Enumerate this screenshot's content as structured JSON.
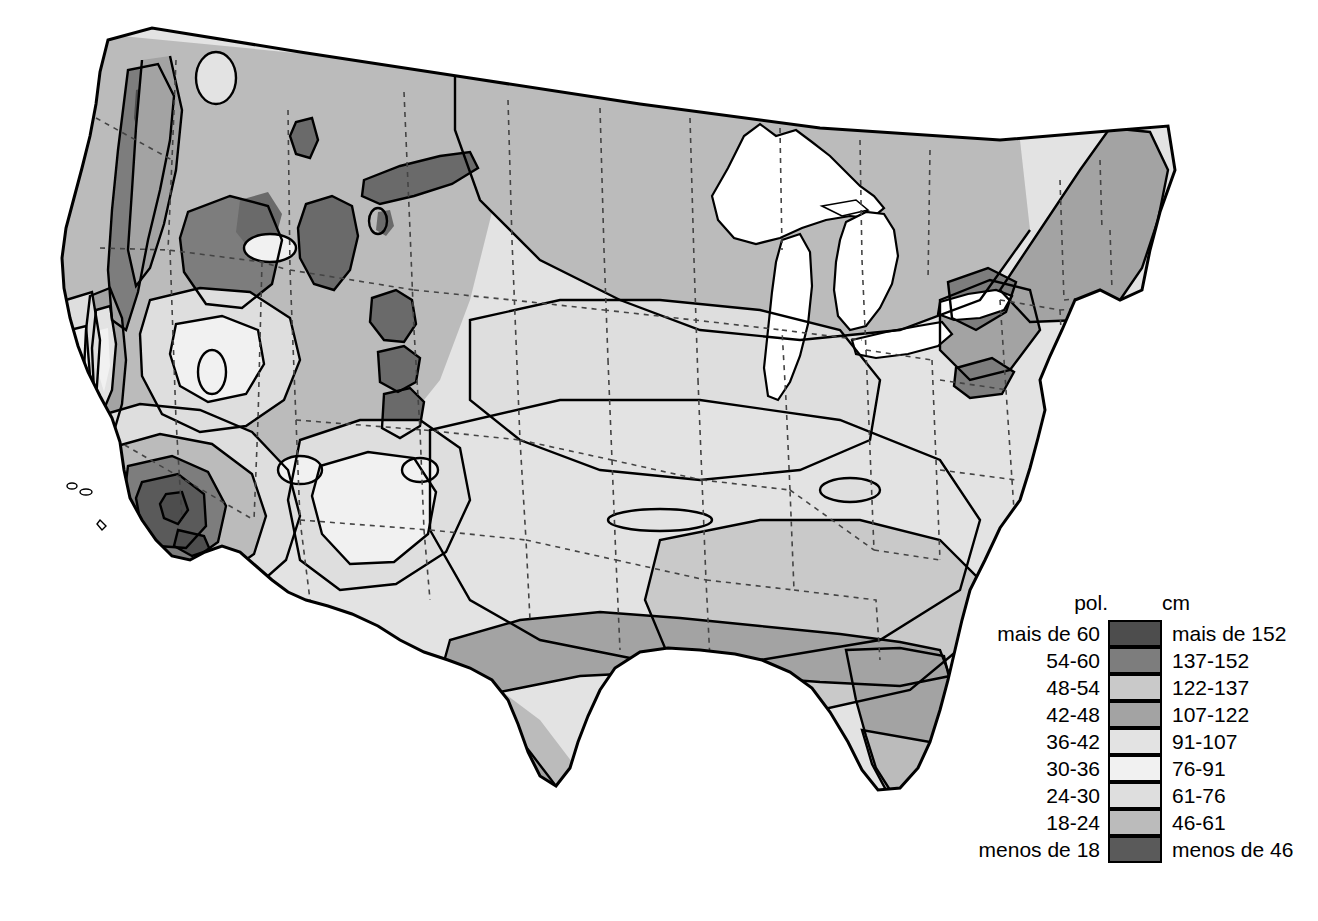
{
  "figure": {
    "background_color": "#ffffff",
    "outline_color": "#000000",
    "state_border_color": "#555555"
  },
  "legend": {
    "header_left": "pol.",
    "header_right": "cm",
    "rows": [
      {
        "inches": "mais de 60",
        "cm": "mais de 152",
        "color": "#4d4d4d"
      },
      {
        "inches": "54-60",
        "cm": "137-152",
        "color": "#7d7d7d"
      },
      {
        "inches": "48-54",
        "cm": "122-137",
        "color": "#c9c9c9"
      },
      {
        "inches": "42-48",
        "cm": "107-122",
        "color": "#a3a3a3"
      },
      {
        "inches": "36-42",
        "cm": "91-107",
        "color": "#e3e3e3"
      },
      {
        "inches": "30-36",
        "cm": "76-91",
        "color": "#f1f1f1"
      },
      {
        "inches": "24-30",
        "cm": "61-76",
        "color": "#dedede"
      },
      {
        "inches": "18-24",
        "cm": "46-61",
        "color": "#bbbbbb"
      },
      {
        "inches": "menos de 18",
        "cm": "menos de 46",
        "color": "#5a5a5a"
      }
    ]
  },
  "chart_data": {
    "type": "map",
    "units_primary": "pol.",
    "units_secondary": "cm",
    "classes": [
      {
        "label_in": "mais de 60",
        "label_cm": "mais de 152",
        "min_in": 60,
        "max_in": null,
        "min_cm": 152,
        "max_cm": null,
        "color": "#4d4d4d"
      },
      {
        "label_in": "54-60",
        "label_cm": "137-152",
        "min_in": 54,
        "max_in": 60,
        "min_cm": 137,
        "max_cm": 152,
        "color": "#7d7d7d"
      },
      {
        "label_in": "48-54",
        "label_cm": "122-137",
        "min_in": 48,
        "max_in": 54,
        "min_cm": 122,
        "max_cm": 137,
        "color": "#c9c9c9"
      },
      {
        "label_in": "42-48",
        "label_cm": "107-122",
        "min_in": 42,
        "max_in": 48,
        "min_cm": 107,
        "max_cm": 122,
        "color": "#a3a3a3"
      },
      {
        "label_in": "36-42",
        "label_cm": "91-107",
        "min_in": 36,
        "max_in": 42,
        "min_cm": 91,
        "max_cm": 107,
        "color": "#e3e3e3"
      },
      {
        "label_in": "30-36",
        "label_cm": "76-91",
        "min_in": 30,
        "max_in": 36,
        "min_cm": 76,
        "max_cm": 91,
        "color": "#f1f1f1"
      },
      {
        "label_in": "24-30",
        "label_cm": "61-76",
        "min_in": 24,
        "max_in": 30,
        "min_cm": 61,
        "max_cm": 76,
        "color": "#dedede"
      },
      {
        "label_in": "18-24",
        "label_cm": "46-61",
        "min_in": 18,
        "max_in": 24,
        "min_cm": 46,
        "max_cm": 61,
        "color": "#bbbbbb"
      },
      {
        "label_in": "menos de 18",
        "label_cm": "menos de 46",
        "min_in": null,
        "max_in": 18,
        "min_cm": null,
        "max_cm": 46,
        "color": "#5a5a5a"
      }
    ],
    "regions": [
      {
        "name": "Noroeste do Pacífico (costa)",
        "class_in": "mais de 60",
        "class_cm": "mais de 152"
      },
      {
        "name": "Montanhas Rochosas do norte",
        "class_in": "54-60",
        "class_cm": "137-152"
      },
      {
        "name": "Grandes Planícies",
        "class_in": "18-24",
        "class_cm": "46-61"
      },
      {
        "name": "Sudoeste deserto",
        "class_in": "menos de 18",
        "class_cm": "menos de 46"
      },
      {
        "name": "Costa do Golfo",
        "class_in": "48-54",
        "class_cm": "122-137"
      },
      {
        "name": "Nova Inglaterra",
        "class_in": "42-48",
        "class_cm": "107-122"
      },
      {
        "name": "Flórida",
        "class_in": "48-54",
        "class_cm": "122-137"
      },
      {
        "name": "Vale do Mississippi",
        "class_in": "42-48",
        "class_cm": "107-122"
      }
    ],
    "legend_position": "bottom-right",
    "grid": false
  }
}
